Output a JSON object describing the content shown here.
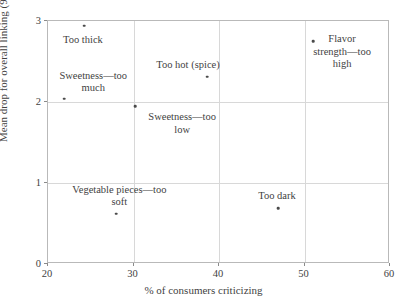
{
  "chart_data": {
    "type": "scatter",
    "title": "",
    "xlabel": "% of consumers criticizing",
    "ylabel": "Mean drop for overall linking (9-point scale)",
    "xlim": [
      20,
      60
    ],
    "ylim": [
      0,
      3
    ],
    "xticks": [
      20,
      30,
      40,
      50,
      60
    ],
    "yticks": [
      0,
      1,
      2,
      3
    ],
    "xtick_labels": [
      "20",
      "30",
      "40",
      "50",
      "60"
    ],
    "ytick_labels": [
      "0",
      "1",
      "2",
      "3"
    ],
    "grid": true,
    "legend": "none",
    "marker_color": "#4a4a4a",
    "points": [
      {
        "label": "Too thick",
        "x": 24.2,
        "y": 2.94,
        "label_lines": "Too thick",
        "label_dx": 0,
        "label_dy": 9
      },
      {
        "label": "Sweetness—too much",
        "x": 21.9,
        "y": 2.04,
        "label_lines": "Sweetness—too\nmuch",
        "label_dx": 30,
        "label_dy": -28
      },
      {
        "label": "Too hot (spice)",
        "x": 38.6,
        "y": 2.31,
        "label_lines": "Too hot (spice)",
        "label_dx": -18,
        "label_dy": -17
      },
      {
        "label": "Flavor strength—too high",
        "x": 51.0,
        "y": 2.75,
        "label_lines": "Flavor\nstrength—too high",
        "label_dx": 30,
        "label_dy": -7
      },
      {
        "label": "Sweetness—too low",
        "x": 30.2,
        "y": 1.95,
        "label_lines": "Sweetness—too\nlow",
        "label_dx": 48,
        "label_dy": 6
      },
      {
        "label": "Vegetable pieces—too soft",
        "x": 28.0,
        "y": 0.62,
        "label_lines": "Vegetable pieces—too\nsoft",
        "label_dx": 4,
        "label_dy": -29
      },
      {
        "label": "Too dark",
        "x": 46.9,
        "y": 0.69,
        "label_lines": "Too dark",
        "label_dx": 0,
        "label_dy": -17
      }
    ]
  }
}
